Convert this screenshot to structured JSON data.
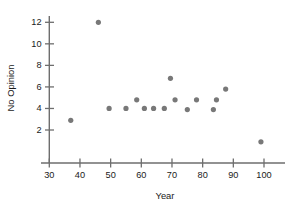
{
  "chart_data": {
    "type": "scatter",
    "title": "",
    "xlabel": "Year",
    "ylabel": "No Opinion",
    "xlim": [
      27,
      107
    ],
    "ylim": [
      0,
      13
    ],
    "grid": false,
    "legend": "none",
    "x_ticks": [
      30,
      40,
      50,
      60,
      70,
      80,
      90,
      100
    ],
    "y_ticks": [
      2,
      4,
      6,
      8,
      10,
      12
    ],
    "x_tick_labels": [
      "30",
      "40",
      "50",
      "60",
      "70",
      "80",
      "90",
      "100"
    ],
    "y_tick_labels": [
      "2",
      "4",
      "6",
      "8",
      "10",
      "12"
    ],
    "point_color": "#787878",
    "axis_color": "#6e6e6e",
    "points": [
      {
        "x": 37,
        "y": 2.9
      },
      {
        "x": 46,
        "y": 12.0
      },
      {
        "x": 49.5,
        "y": 4.0
      },
      {
        "x": 55,
        "y": 4.0
      },
      {
        "x": 58.5,
        "y": 4.8
      },
      {
        "x": 61,
        "y": 4.0
      },
      {
        "x": 64,
        "y": 4.0
      },
      {
        "x": 67.5,
        "y": 4.0
      },
      {
        "x": 69.5,
        "y": 6.8
      },
      {
        "x": 71,
        "y": 4.8
      },
      {
        "x": 75,
        "y": 3.9
      },
      {
        "x": 78,
        "y": 4.8
      },
      {
        "x": 83.5,
        "y": 3.9
      },
      {
        "x": 84.5,
        "y": 4.8
      },
      {
        "x": 87.5,
        "y": 5.8
      },
      {
        "x": 99,
        "y": 0.9
      }
    ]
  }
}
